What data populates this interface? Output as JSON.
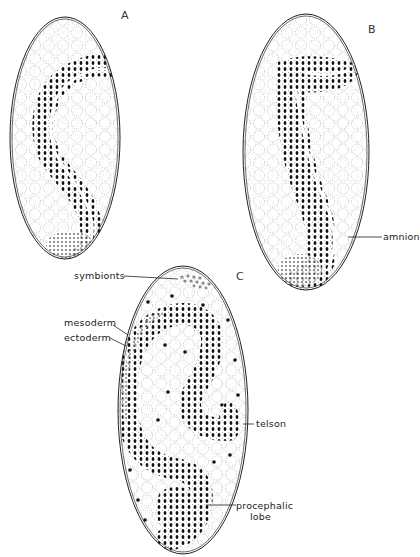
{
  "figure": {
    "panels": [
      {
        "id": "A",
        "letter": "A"
      },
      {
        "id": "B",
        "letter": "B"
      },
      {
        "id": "C",
        "letter": "C"
      }
    ],
    "labels": {
      "amnion": "amnion",
      "symbionts": "symbionts",
      "mesoderm": "mesoderm",
      "ectoderm": "ectoderm",
      "telson": "telson",
      "procephalic_1": "procephalic",
      "procephalic_2": "lobe"
    },
    "colors": {
      "ink": "#1a1a1a",
      "paper": "#ffffff",
      "yolk_dots": "#777777"
    }
  }
}
